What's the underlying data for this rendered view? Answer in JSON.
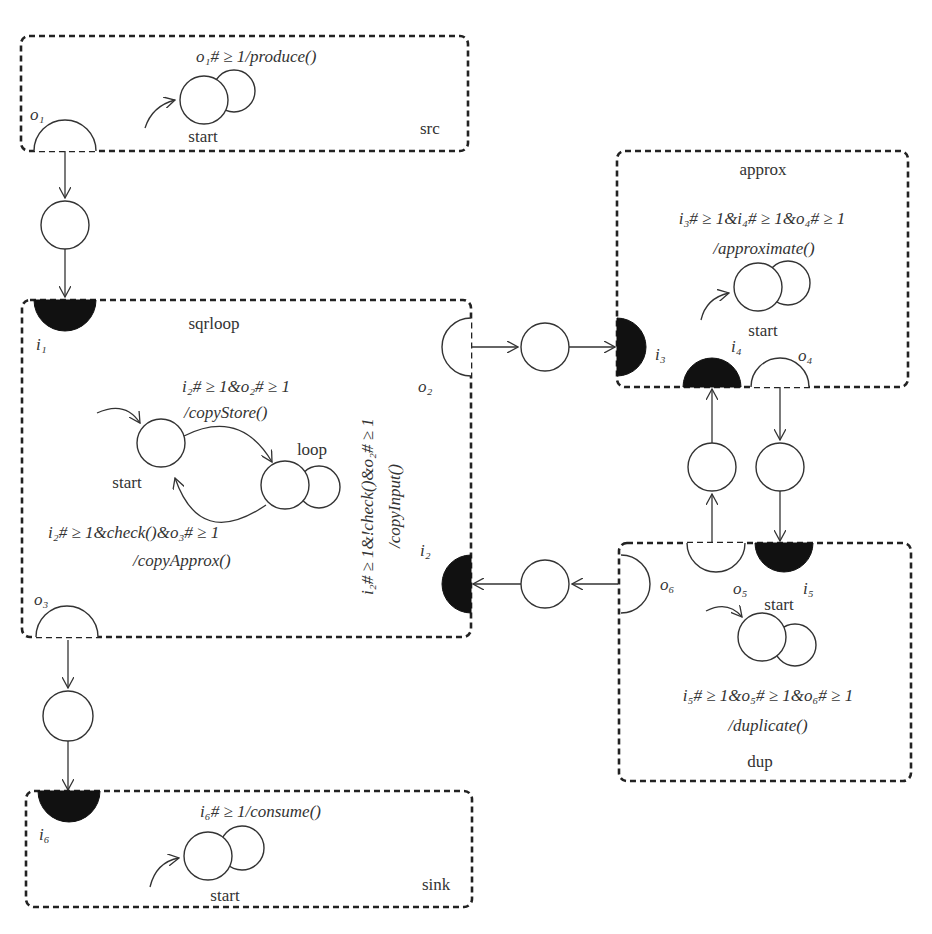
{
  "diagram": {
    "components": {
      "src": {
        "name": "src",
        "guard": "o₁# ≥ 1/produce()",
        "state": "start"
      },
      "sqrloop": {
        "name": "sqrloop",
        "states": [
          "start",
          "loop"
        ],
        "t_copyStore_guard": "i₂# ≥ 1&o₂# ≥ 1",
        "t_copyStore_action": "/copyStore()",
        "t_copyApprox_guard": "i₂# ≥ 1&check()&o₃# ≥ 1",
        "t_copyApprox_action": "/copyApprox()",
        "t_copyInput_guard": "i₂# ≥ 1&!check()&o₂# ≥ 1",
        "t_copyInput_action": "/copyInput()"
      },
      "approx": {
        "name": "approx",
        "guard": "i₃# ≥ 1&i₄# ≥ 1&o₄# ≥ 1",
        "action": "/approximate()",
        "state": "start"
      },
      "dup": {
        "name": "dup",
        "guard": "i₅# ≥ 1&o₅# ≥ 1&o₆# ≥ 1",
        "action": "/duplicate()",
        "state": "start"
      },
      "sink": {
        "name": "sink",
        "guard": "i₆# ≥ 1/consume()",
        "state": "start"
      }
    },
    "ports": {
      "o1": "o₁",
      "i1": "i₁",
      "o2": "o₂",
      "i2": "i₂",
      "o3": "o₃",
      "i3": "i₃",
      "i4": "i₄",
      "o4": "o₄",
      "o5": "o₅",
      "i5": "i₅",
      "o6": "o₆",
      "i6": "i₆"
    },
    "channels": [
      {
        "from": "o1",
        "to": "i1"
      },
      {
        "from": "o2",
        "to": "i3"
      },
      {
        "from": "o3",
        "to": "i6"
      },
      {
        "from": "o4",
        "to": "i5"
      },
      {
        "from": "o5",
        "to": "i4"
      },
      {
        "from": "o6",
        "to": "i2"
      }
    ]
  }
}
